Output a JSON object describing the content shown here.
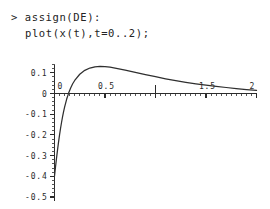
{
  "session": {
    "prompt": ">",
    "lines": [
      {
        "text": "assign(DE):",
        "has_prompt": true
      },
      {
        "text": "plot(x(t),t=0..2);",
        "has_prompt": false
      }
    ],
    "line1_full": "> assign(DE):",
    "line2_full": "plot(x(t),t=0..2);"
  },
  "colors": {
    "background": "#ffffff",
    "text": "#232323",
    "axis": "#2b2b2b",
    "curve": "#2f2f2f"
  },
  "chart_data": {
    "type": "line",
    "title": "",
    "xlabel": "",
    "ylabel": "",
    "xlim": [
      0,
      2
    ],
    "ylim": [
      -0.5,
      0.14
    ],
    "grid": false,
    "legend": null,
    "x_ticks": [
      0,
      0.5,
      1,
      1.5,
      2
    ],
    "x_tick_labels": [
      "0",
      "0.5",
      "",
      "1.5",
      "2"
    ],
    "y_ticks": [
      0.1,
      0,
      -0.1,
      -0.2,
      -0.3,
      -0.4,
      -0.5
    ],
    "y_tick_labels": [
      "0.1",
      "0",
      "-0.1",
      "-0.2",
      "-0.3",
      "-0.4",
      "-0.5"
    ],
    "x_minor_tick_step": 0.05,
    "y_minor_tick_step": 0.02,
    "series": [
      {
        "name": "x(t)",
        "x": [
          0.0,
          0.01,
          0.02,
          0.03,
          0.04,
          0.05,
          0.06,
          0.07,
          0.08,
          0.09,
          0.1,
          0.12,
          0.14,
          0.16,
          0.18,
          0.2,
          0.25,
          0.3,
          0.35,
          0.4,
          0.45,
          0.5,
          0.55,
          0.6,
          0.7,
          0.8,
          0.9,
          1.0,
          1.1,
          1.2,
          1.3,
          1.4,
          1.5,
          1.6,
          1.7,
          1.8,
          1.9,
          2.0
        ],
        "y": [
          -0.4,
          -0.355,
          -0.312,
          -0.272,
          -0.235,
          -0.2,
          -0.168,
          -0.139,
          -0.112,
          -0.088,
          -0.066,
          -0.028,
          0.002,
          0.027,
          0.047,
          0.063,
          0.093,
          0.112,
          0.123,
          0.129,
          0.131,
          0.13,
          0.127,
          0.123,
          0.113,
          0.102,
          0.091,
          0.081,
          0.071,
          0.062,
          0.054,
          0.047,
          0.04,
          0.034,
          0.029,
          0.024,
          0.019,
          0.015
        ]
      }
    ],
    "annotations": [
      {
        "type": "tick-marker",
        "x": 1.0,
        "note": "unlabeled major tick at t=1"
      }
    ]
  }
}
